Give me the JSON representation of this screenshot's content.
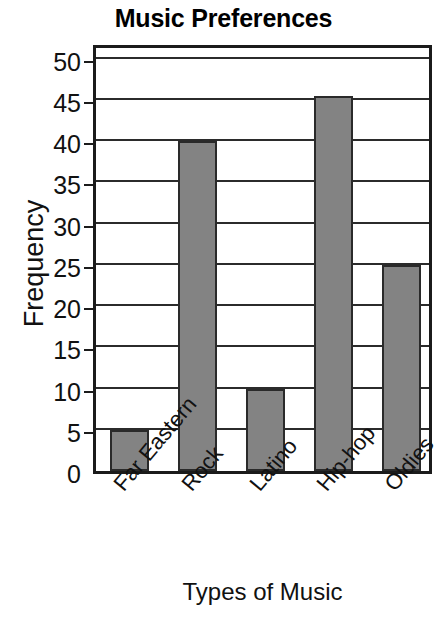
{
  "chart_data": {
    "type": "bar",
    "title": "Music Preferences",
    "xlabel": "Types of Music",
    "ylabel": "Frequency",
    "categories": [
      "Far Eastern",
      "Rock",
      "Latino",
      "Hip-hop",
      "Oldies"
    ],
    "values": [
      5,
      40,
      10,
      45.5,
      25
    ],
    "ylim": [
      0,
      52
    ],
    "yticks": [
      0,
      5,
      10,
      15,
      20,
      25,
      30,
      35,
      40,
      45,
      50
    ],
    "ytick_labels": [
      "0",
      "5",
      "10",
      "15",
      "20",
      "25",
      "30",
      "35",
      "40",
      "45",
      "50"
    ],
    "grid": true,
    "legend": false,
    "bar_color": "#838383",
    "bar_edge_color": "#2a2a2a",
    "axis_color": "#1b1b1b",
    "xtick_rotation": -50
  }
}
